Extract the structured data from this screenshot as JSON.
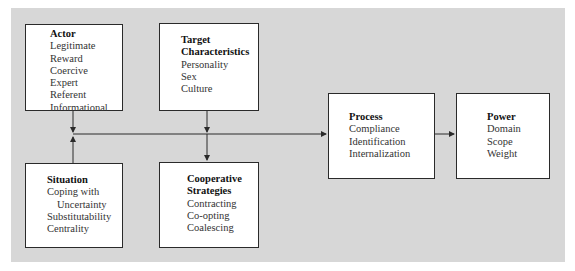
{
  "diagram": {
    "actor": {
      "title": "Actor",
      "items": [
        "Legitimate",
        "Reward",
        "Coercive",
        "Expert",
        "Referent",
        "Informational"
      ]
    },
    "target": {
      "title_line1": "Target",
      "title_line2": "Characteristics",
      "items": [
        "Personality",
        "Sex",
        "Culture"
      ]
    },
    "situation": {
      "title": "Situation",
      "items": [
        "Coping with",
        "Uncertainty",
        "Substitutability",
        "Centrality"
      ]
    },
    "cooperative": {
      "title_line1": "Cooperative",
      "title_line2": "Strategies",
      "items": [
        "Contracting",
        "Co-opting",
        "Coalescing"
      ]
    },
    "process": {
      "title": "Process",
      "items": [
        "Compliance",
        "Identification",
        "Internalization"
      ]
    },
    "power": {
      "title": "Power",
      "items": [
        "Domain",
        "Scope",
        "Weight"
      ]
    },
    "colors": {
      "panel": "#d7d7d7",
      "box": "#ffffff",
      "line": "#2a2a2a"
    }
  }
}
